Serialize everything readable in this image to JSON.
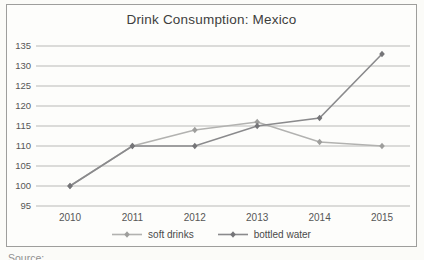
{
  "chart_data": {
    "type": "line",
    "title": "Drink Consumption: Mexico",
    "categories": [
      "2010",
      "2011",
      "2012",
      "2013",
      "2014",
      "2015"
    ],
    "series": [
      {
        "name": "soft drinks",
        "values": [
          100,
          110,
          114,
          116,
          111,
          110
        ],
        "line_color": "#b2b2b0",
        "marker_color": "#9e9e9c"
      },
      {
        "name": "bottled water",
        "values": [
          100,
          110,
          110,
          115,
          117,
          133
        ],
        "line_color": "#8a8a8c",
        "marker_color": "#757578"
      }
    ],
    "ylim": [
      95,
      135
    ],
    "yticks": [
      95,
      100,
      105,
      110,
      115,
      120,
      125,
      130,
      135
    ],
    "marker": "diamond",
    "grid": "horizontal",
    "gridline_color": "#b9b9b7",
    "legend_position": "bottom",
    "xlabel": "",
    "ylabel": ""
  },
  "footer": {
    "caption": "Source: ..."
  }
}
